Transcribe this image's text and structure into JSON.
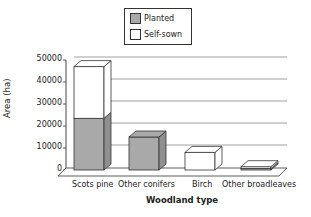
{
  "chart_data": {
    "type": "bar",
    "stacked": true,
    "style": "3d",
    "title": "",
    "xlabel": "Woodland type",
    "ylabel": "Area (ha)",
    "ylim": [
      0,
      50000
    ],
    "yticks": [
      "0",
      "10000",
      "20000",
      "30000",
      "40000",
      "50000"
    ],
    "grid": true,
    "legend_position": "top",
    "categories": [
      "Scots pine",
      "Other conifers",
      "Birch",
      "Other broadleaves"
    ],
    "series": [
      {
        "name": "Planted",
        "color": "#a9a9a9",
        "values": [
          23500,
          15000,
          0,
          700
        ]
      },
      {
        "name": "Self-sown",
        "color": "#ffffff",
        "values": [
          23500,
          0,
          8000,
          800
        ]
      }
    ]
  },
  "legend": {
    "items": [
      "Planted",
      "Self-sown"
    ]
  }
}
